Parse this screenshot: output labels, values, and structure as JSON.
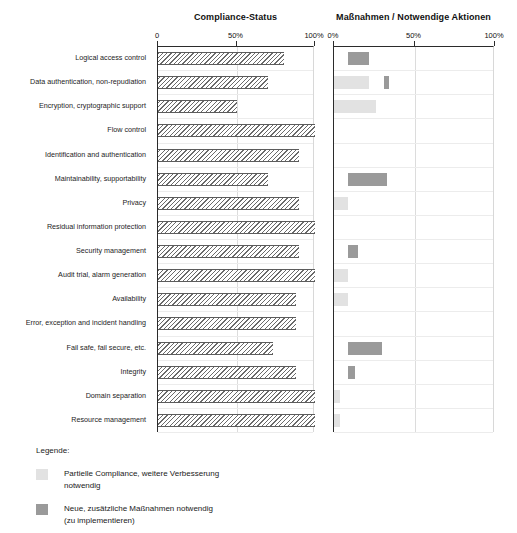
{
  "charts": {
    "left": {
      "title": "Compliance-Status",
      "axis_ticks": [
        "0",
        "50%",
        "100%"
      ]
    },
    "right": {
      "title": "Maßnahmen / Notwendige Aktionen",
      "axis_ticks": [
        "0%",
        "50%",
        "100%"
      ]
    }
  },
  "legend": {
    "title": "Legende:",
    "items": [
      {
        "color": "#e2e2e2",
        "label": "Partielle Compliance, weitere Verbesserung\nnotwendig"
      },
      {
        "color": "#9a9a9a",
        "label": "Neue, zusätzliche Maßnahmen notwendig\n(zu implementieren)"
      }
    ]
  },
  "colors": {
    "hatch_line": "#6a6a6a",
    "bar_dark": "#9a9a9a",
    "bar_light": "#e2e2e2",
    "axis": "#2b2b2b",
    "gridline": "#dcdcdc"
  },
  "chart_data": {
    "type": "bar",
    "orientation": "horizontal",
    "xlabel": "",
    "ylabel": "",
    "xlim": [
      0,
      100
    ],
    "grid": true,
    "legend_position": "bottom-left",
    "categories": [
      "Logical access control",
      "Data authentication, non-repudiation",
      "Encryption, cryptographic support",
      "Flow control",
      "Identification and authentication",
      "Maintainability, supportability",
      "Privacy",
      "Residual information protection",
      "Security management",
      "Audit trial, alarm generation",
      "Availability",
      "Error, exception and incident handling",
      "Fail safe, fail secure, etc.",
      "Integrity",
      "Domain separation",
      "Resource management"
    ],
    "panels": [
      {
        "name": "Compliance-Status",
        "xlabel": "",
        "tick_labels": [
          "0",
          "50%",
          "100%"
        ],
        "tick_values": [
          0,
          50,
          100
        ],
        "series": [
          {
            "name": "Compliance",
            "style": "hatched",
            "values": [
              80,
              70,
              50,
              100,
              90,
              70,
              90,
              100,
              90,
              100,
              88,
              88,
              73,
              88,
              100,
              100
            ]
          }
        ]
      },
      {
        "name": "Maßnahmen / Notwendige Aktionen",
        "xlabel": "",
        "tick_labels": [
          "0%",
          "50%",
          "100%"
        ],
        "tick_values": [
          0,
          50,
          100
        ],
        "series": [
          {
            "name": "Neue, zusätzliche Maßnahmen notwendig (zu implementieren)",
            "style": "solid-dark",
            "color": "#9a9a9a",
            "bars": [
              {
                "category": "Logical access control",
                "start": 9,
                "end": 22
              },
              {
                "category": "Data authentication, non-repudiation",
                "start": 31,
                "end": 34
              },
              {
                "category": "Maintainability, supportability",
                "start": 9,
                "end": 33
              },
              {
                "category": "Security management",
                "start": 9,
                "end": 15
              },
              {
                "category": "Fail safe, fail secure, etc.",
                "start": 9,
                "end": 30
              },
              {
                "category": "Integrity",
                "start": 9,
                "end": 13
              }
            ]
          },
          {
            "name": "Partielle Compliance, weitere Verbesserung notwendig",
            "style": "solid-light",
            "color": "#e2e2e2",
            "bars": [
              {
                "category": "Data authentication, non-repudiation",
                "start": 0,
                "end": 22
              },
              {
                "category": "Encryption, cryptographic support",
                "start": 0,
                "end": 26
              },
              {
                "category": "Privacy",
                "start": 0,
                "end": 9
              },
              {
                "category": "Audit trial, alarm generation",
                "start": 0,
                "end": 9
              },
              {
                "category": "Availability",
                "start": 0,
                "end": 9
              },
              {
                "category": "Domain separation",
                "start": 0,
                "end": 4
              },
              {
                "category": "Resource management",
                "start": 0,
                "end": 4
              }
            ]
          }
        ]
      }
    ]
  }
}
